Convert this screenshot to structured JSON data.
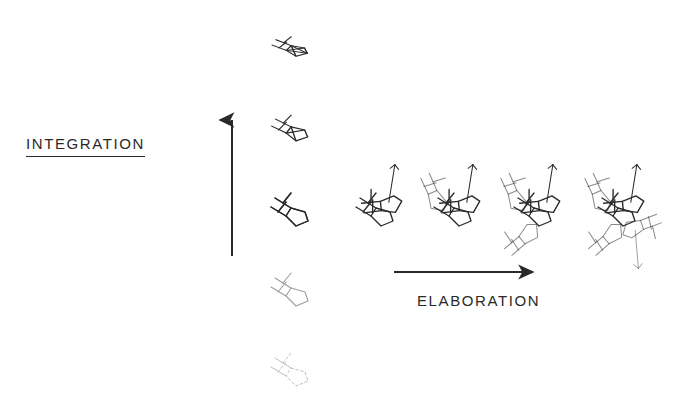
{
  "diagram": {
    "title_vertical": "INTEGRATION",
    "title_horizontal": "ELABORATION",
    "stroke_color": "#2a2a2a",
    "background_color": "#ffffff",
    "axes": {
      "vertical": {
        "name": "integration-axis",
        "label": "INTEGRATION",
        "direction": "up",
        "x": 232,
        "y_start": 256,
        "y_end": 117
      },
      "horizontal": {
        "name": "elaboration-axis",
        "label": "ELABORATION",
        "direction": "right",
        "y": 272,
        "x_start": 394,
        "x_end": 537
      }
    },
    "integration_column": {
      "description": "Single motif drawn at five levels of integration, faintest at bottom, most integrated and compressed at top",
      "x": 295,
      "steps": [
        {
          "name": "integration-step-5",
          "level": 5,
          "label": "most integrated",
          "y": 48,
          "opacity": 1.0,
          "stroke_width": 1.5,
          "dashed": false,
          "scale": 0.95,
          "squash": 0.62
        },
        {
          "name": "integration-step-4",
          "level": 4,
          "label": "highly integrated",
          "y": 130,
          "opacity": 1.0,
          "stroke_width": 1.4,
          "dashed": false,
          "scale": 0.97,
          "squash": 0.8
        },
        {
          "name": "integration-step-3",
          "level": 3,
          "label": "base motif",
          "y": 212,
          "opacity": 1.0,
          "stroke_width": 1.3,
          "dashed": false,
          "scale": 1.0,
          "squash": 1.0
        },
        {
          "name": "integration-step-2",
          "level": 2,
          "label": "faint",
          "y": 292,
          "opacity": 0.45,
          "stroke_width": 1.1,
          "dashed": false,
          "scale": 1.0,
          "squash": 1.0
        },
        {
          "name": "integration-step-1",
          "level": 1,
          "label": "faintest, partly dotted",
          "y": 372,
          "opacity": 0.3,
          "stroke_width": 1.0,
          "dashed": true,
          "scale": 1.0,
          "squash": 1.0
        }
      ]
    },
    "elaboration_row": {
      "description": "Motif accumulates additional rotated copies from left to right",
      "y": 212,
      "steps": [
        {
          "name": "elaboration-step-1",
          "level": 1,
          "copies": 1,
          "x": 295,
          "label": "base motif"
        },
        {
          "name": "elaboration-step-2",
          "level": 2,
          "copies": 2,
          "x": 380,
          "label": "two units"
        },
        {
          "name": "elaboration-step-3",
          "level": 3,
          "copies": 3,
          "x": 458,
          "label": "three units"
        },
        {
          "name": "elaboration-step-4",
          "level": 4,
          "copies": 4,
          "x": 538,
          "label": "four units"
        },
        {
          "name": "elaboration-step-5",
          "level": 5,
          "copies": 5,
          "x": 622,
          "label": "five units"
        }
      ]
    }
  }
}
